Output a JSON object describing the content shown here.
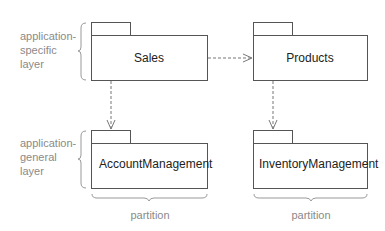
{
  "layers": [
    {
      "id": "specific",
      "label_lines": [
        "application-",
        "specific",
        "layer"
      ]
    },
    {
      "id": "general",
      "label_lines": [
        "application-",
        "general",
        "layer"
      ]
    }
  ],
  "packages": {
    "sales": "Sales",
    "products": "Products",
    "account": "AccountManagement",
    "inventory": "InventoryManagement"
  },
  "dependencies": [
    {
      "from": "Sales",
      "to": "Products"
    },
    {
      "from": "Sales",
      "to": "AccountManagement"
    },
    {
      "from": "Products",
      "to": "InventoryManagement"
    }
  ],
  "partitions": [
    "partition",
    "partition"
  ],
  "colors": {
    "line": "#555555",
    "dash": "#777777",
    "annotation": "#8a8a8a"
  }
}
